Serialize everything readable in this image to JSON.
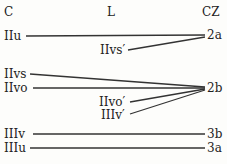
{
  "headers": {
    "left": "C",
    "middle": "L",
    "right": "CZ"
  },
  "left_labels": [
    "IIu",
    "IIvs",
    "IIvo",
    "IIIv",
    "IIIu"
  ],
  "middle_labels": [
    "IIvs′",
    "IIvo′",
    "IIIv′"
  ],
  "right_labels": [
    "2a",
    "2b",
    "3b",
    "3a"
  ],
  "connections": [
    {
      "from": "IIu",
      "to": "2a"
    },
    {
      "from": "IIvs′",
      "to": "2a"
    },
    {
      "from": "IIvs",
      "to": "2b"
    },
    {
      "from": "IIvo",
      "to": "2b"
    },
    {
      "from": "IIvo′",
      "to": "2b"
    },
    {
      "from": "IIIv′",
      "to": "2b"
    },
    {
      "from": "IIIv",
      "to": "3b"
    },
    {
      "from": "IIIu",
      "to": "3a"
    }
  ]
}
